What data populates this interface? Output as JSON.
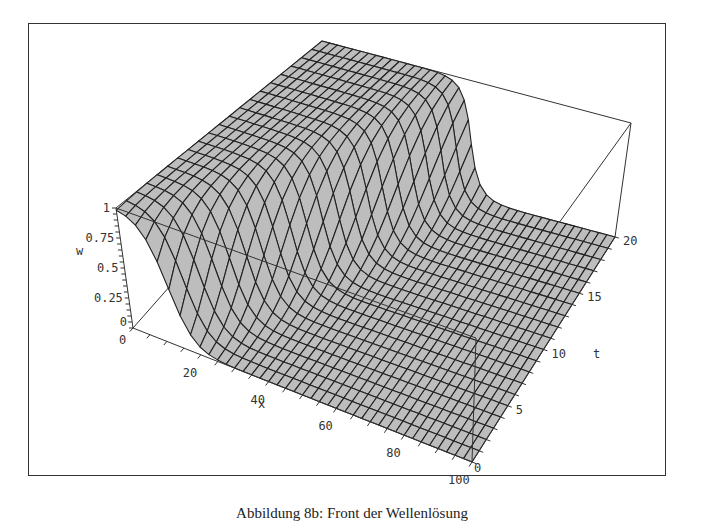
{
  "chart_data": {
    "type": "surface3d",
    "title": "",
    "function_description": "travelling wave front w(x,t), w≈1 behind the front, w≈0 ahead; front moves toward larger x as t grows",
    "x": {
      "label": "x",
      "range": [
        0,
        100
      ],
      "ticks": [
        0,
        20,
        40,
        60,
        80,
        100
      ],
      "grid_divisions": 40
    },
    "t": {
      "label": "t",
      "range": [
        0,
        20
      ],
      "ticks": [
        0,
        5,
        10,
        15,
        20
      ],
      "grid_divisions": 20
    },
    "w": {
      "label": "w",
      "range": [
        0,
        1
      ],
      "ticks": [
        "0",
        "0.25",
        "0.5",
        "0.75",
        "1"
      ]
    },
    "front": {
      "x_at_t0": 12,
      "speed": 2,
      "width": 3
    },
    "surface_color": "#bdbdbd",
    "mesh_color": "#222222",
    "box": true
  },
  "caption": "Abbildung 8b: Front der Wellenlösung"
}
